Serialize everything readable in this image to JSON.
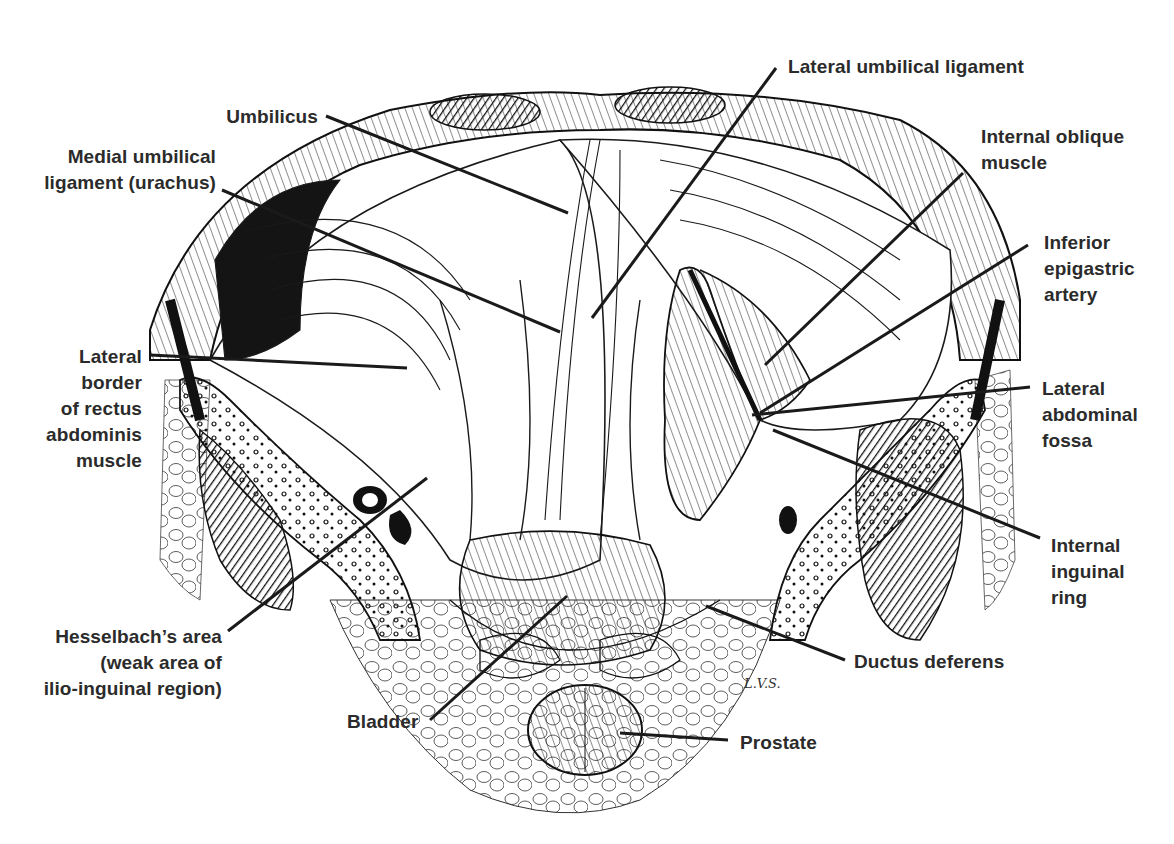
{
  "figure": {
    "type": "anatomical illustration",
    "signature": "L.V.S."
  },
  "labels": {
    "lateral_umbilical_ligament": "Lateral umbilical ligament",
    "umbilicus": "Umbilicus",
    "medial_umbilical_ligament": "Medial umbilical\nligament (urachus)",
    "internal_oblique_muscle": "Internal oblique\nmuscle",
    "inferior_epigastric_artery": "Inferior\nepigastric\nartery",
    "lateral_border_rectus": "Lateral\nborder\nof rectus\nabdominis\nmuscle",
    "lateral_abdominal_fossa": "Lateral\nabdominal\nfossa",
    "internal_inguinal_ring": "Internal\ninguinal\nring",
    "hesselbachs_area": "Hesselbach’s area\n(weak area of\nilio-inguinal region)",
    "ductus_deferens": "Ductus deferens",
    "bladder": "Bladder",
    "prostate": "Prostate"
  },
  "colors": {
    "ink": "#1a1a1a",
    "label_text": "#2b2b2b",
    "background": "#ffffff"
  }
}
